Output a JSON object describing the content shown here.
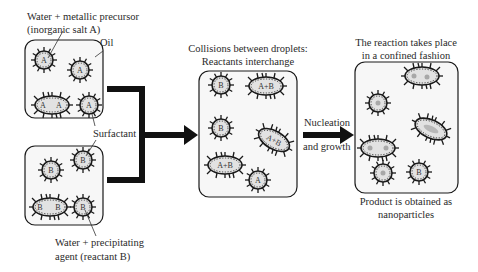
{
  "labels": {
    "water_metallic_line1": "Water + metallic precursor",
    "water_metallic_line2": "(inorganic salt A)",
    "oil": "Oil",
    "surfactant": "Surfactant",
    "water_precip_line1": "Water + precipitating",
    "water_precip_line2": "agent (reactant B)",
    "collisions_line1": "Collisions between droplets:",
    "collisions_line2": "Reactants interchange",
    "nucleation": "Nucleation",
    "growth": "and growth",
    "confined_line1": "The reaction takes place",
    "confined_line2": "in a confined fashion",
    "product_line1": "Product is obtained as",
    "product_line2": "nanoparticles"
  },
  "droplets": {
    "box_a": [
      "A",
      "A",
      "A",
      "A",
      "A"
    ],
    "box_b": [
      "B",
      "B",
      "B",
      "B",
      "B"
    ],
    "box_mix": [
      "B",
      "A+B",
      "B",
      "A+B",
      "A+B",
      "A"
    ],
    "box_product": [
      "",
      "",
      "",
      "",
      "",
      "B"
    ]
  },
  "colors": {
    "stroke": "#1a1a1a",
    "box_fill": "#f7f7f7",
    "droplet_fill": "#dcdcdc",
    "particle": "#a8a8a8"
  }
}
